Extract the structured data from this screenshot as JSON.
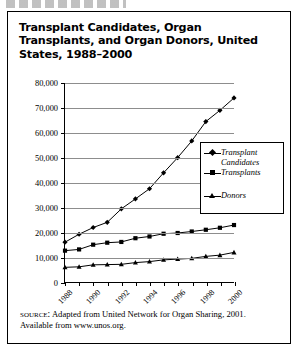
{
  "figure": {
    "label_truncated": "",
    "title": "Transplant Candidates, Organ Transplants, and Organ Donors, United States, 1988–2000"
  },
  "source": {
    "keyword": "source:",
    "text": " Adapted from United Network for Organ Sharing, 2001. Available from www.unos.org."
  },
  "legend": {
    "position": "inside-right",
    "items": [
      {
        "label": "Transplant\nCandidates",
        "marker": "diamond"
      },
      {
        "label": "Transplants",
        "marker": "square"
      },
      {
        "label": "Donors",
        "marker": "triangle"
      }
    ]
  },
  "chart_data": {
    "type": "line",
    "title": "Transplant Candidates, Organ Transplants, and Organ Donors, United States, 1988–2000",
    "xlabel": "",
    "ylabel": "",
    "grid": true,
    "legend_position": "inside-right",
    "x": [
      1988,
      1989,
      1990,
      1991,
      1992,
      1993,
      1994,
      1995,
      1996,
      1997,
      1998,
      1999,
      2000
    ],
    "xtick_labels": [
      "1988",
      "",
      "1990",
      "",
      "1992",
      "",
      "1994",
      "",
      "1996",
      "",
      "1998",
      "",
      "2000"
    ],
    "xlim": [
      1988,
      2000
    ],
    "ylim": [
      0,
      80000
    ],
    "ytick_labels": [
      "0",
      "10,000",
      "20,000",
      "30,000",
      "40,000",
      "50,000",
      "60,000",
      "70,000",
      "80,000"
    ],
    "yticks": [
      0,
      10000,
      20000,
      30000,
      40000,
      50000,
      60000,
      70000,
      80000
    ],
    "series": [
      {
        "name": "Transplant Candidates",
        "marker": "diamond",
        "color": "#000000",
        "values": [
          16000,
          19200,
          21900,
          24000,
          29400,
          33400,
          37500,
          43900,
          50000,
          56700,
          64500,
          69000,
          74000
        ]
      },
      {
        "name": "Transplants",
        "marker": "square",
        "color": "#000000",
        "values": [
          12600,
          13100,
          15000,
          15800,
          16100,
          17600,
          18300,
          19400,
          19700,
          20300,
          21000,
          21800,
          22900
        ]
      },
      {
        "name": "Donors",
        "marker": "triangle",
        "color": "#000000",
        "values": [
          5900,
          6100,
          6900,
          7000,
          7100,
          7800,
          8200,
          8900,
          9200,
          9500,
          10300,
          10800,
          11900
        ]
      }
    ]
  }
}
